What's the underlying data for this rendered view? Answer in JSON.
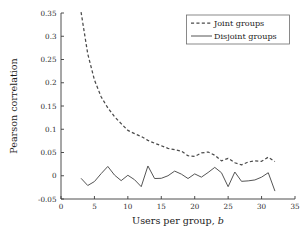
{
  "chart_data": {
    "type": "line",
    "title": "",
    "xlabel": "Users per group, b",
    "xlabel_plain": "Users per group,",
    "xlabel_italic": "b",
    "ylabel": "Pearson correlation",
    "xlim": [
      0,
      35
    ],
    "ylim": [
      -0.05,
      0.35
    ],
    "xticks": [
      0,
      5,
      10,
      15,
      20,
      25,
      30,
      35
    ],
    "xticklabels": [
      "0",
      "5",
      "10",
      "15",
      "20",
      "25",
      "30",
      "35"
    ],
    "yticks": [
      -0.05,
      0,
      0.05,
      0.1,
      0.15,
      0.2,
      0.25,
      0.3,
      0.35
    ],
    "yticklabels": [
      "-0.05",
      "0",
      "0.05",
      "0.1",
      "0.15",
      "0.2",
      "0.25",
      "0.3",
      "0.35"
    ],
    "grid": false,
    "legend_position": "upper right",
    "series": [
      {
        "name": "Joint groups",
        "style": "dashed",
        "color": "#4a4a4a",
        "x": [
          3,
          4,
          5,
          6,
          7,
          8,
          9,
          10,
          11,
          12,
          13,
          14,
          15,
          16,
          17,
          18,
          19,
          20,
          21,
          22,
          23,
          24,
          25,
          26,
          27,
          28,
          29,
          30,
          31,
          32
        ],
        "y": [
          0.352,
          0.262,
          0.206,
          0.17,
          0.146,
          0.127,
          0.112,
          0.0975,
          0.0905,
          0.0845,
          0.076,
          0.07,
          0.0645,
          0.059,
          0.056,
          0.053,
          0.043,
          0.0415,
          0.049,
          0.051,
          0.044,
          0.032,
          0.0375,
          0.028,
          0.0235,
          0.0295,
          0.032,
          0.031,
          0.04,
          0.0305
        ]
      },
      {
        "name": "Disjoint groups",
        "style": "solid",
        "color": "#555555",
        "x": [
          3,
          4,
          5,
          6,
          7,
          8,
          9,
          10,
          11,
          12,
          13,
          14,
          15,
          16,
          17,
          18,
          19,
          20,
          21,
          22,
          23,
          24,
          25,
          26,
          27,
          28,
          29,
          30,
          31,
          32
        ],
        "y": [
          -0.0055,
          -0.021,
          -0.0125,
          0.0045,
          0.02,
          0.0015,
          -0.0105,
          0.001,
          -0.0085,
          -0.0235,
          0.021,
          -0.006,
          -0.0055,
          0.0,
          0.01,
          0.0035,
          -0.006,
          0.004,
          -0.003,
          0.007,
          0.018,
          0.0065,
          -0.0235,
          0.008,
          -0.012,
          -0.011,
          -0.009,
          -0.003,
          0.0065,
          -0.033
        ]
      }
    ],
    "annotations": []
  },
  "legend": {
    "entries": [
      {
        "label": "Joint groups",
        "style": "dashed"
      },
      {
        "label": "Disjoint groups",
        "style": "solid"
      }
    ]
  },
  "figure": {
    "background": "#ffffff",
    "axis_color": "#3a3a3a"
  }
}
